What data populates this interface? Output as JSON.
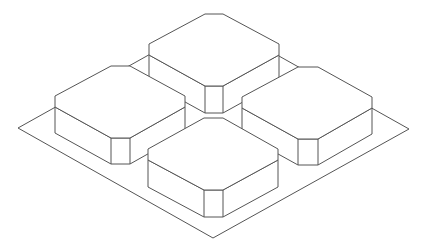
{
  "figure": {
    "line_color": "#555555",
    "background": "#ffffff",
    "block_count": 4,
    "blocks": [
      "back",
      "left",
      "right",
      "front"
    ]
  }
}
